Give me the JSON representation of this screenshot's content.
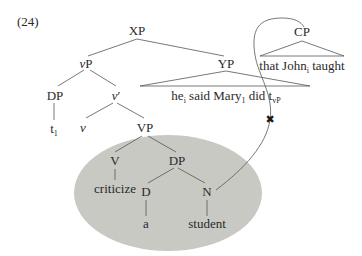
{
  "example_number": "(24)",
  "colors": {
    "ellipse_fill": "#c9c9c4",
    "line": "#555555",
    "text": "#2a2a2a",
    "marker": "#1a1a1a"
  },
  "tree": {
    "root": {
      "label": "XP"
    },
    "vP": {
      "label_italic": "v",
      "label_rest": "P"
    },
    "dp_spec": {
      "label": "DP",
      "trace": "t",
      "trace_index": "1"
    },
    "v_bar": {
      "label_italic": "v",
      "label_rest": "′"
    },
    "v_head": {
      "label_italic": "v"
    },
    "yp": {
      "label": "YP",
      "yield": {
        "part1": "he",
        "part1_index": "i",
        "part2": " said Mary",
        "part2_index": "1",
        "part3": " did t",
        "part3_sub": "vP"
      }
    },
    "vp": {
      "label": "VP"
    },
    "v_inner": {
      "label": "V",
      "word": "criticize"
    },
    "dp_obj": {
      "label": "DP"
    },
    "d": {
      "label": "D",
      "word": "a"
    },
    "n": {
      "label": "N",
      "word": "student"
    },
    "cp": {
      "label": "CP",
      "yield": {
        "part1": "that John",
        "part1_index": "i",
        "part2": " taught"
      }
    }
  },
  "annotations": {
    "blocked_marker": "✖",
    "highlight_region": "VP shaded ellipse",
    "movement_arrow": "curve from N to CP"
  }
}
